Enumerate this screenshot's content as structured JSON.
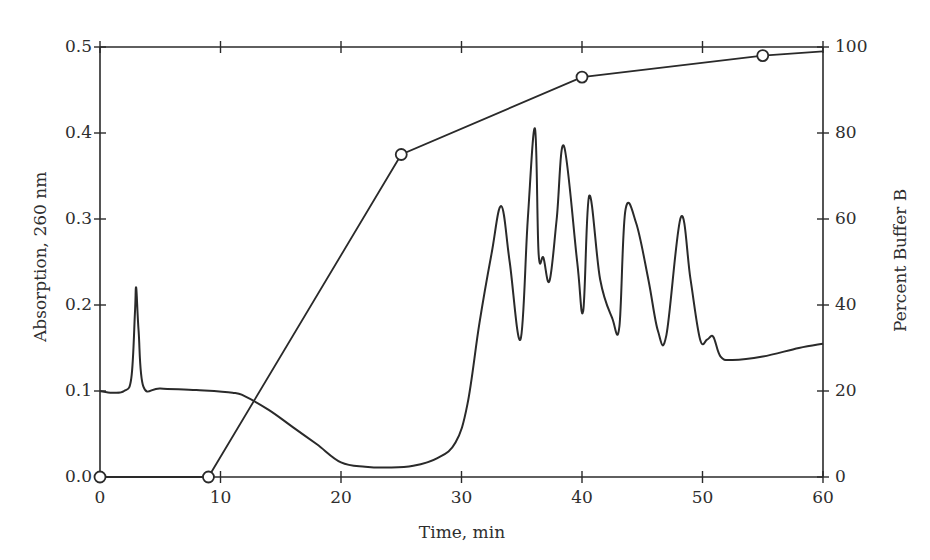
{
  "chart_data": {
    "type": "line",
    "title": "",
    "xlabel": "Time, min",
    "ylabel": "Absorption, 260 nm",
    "y2label": "Percent Buffer B",
    "xlim": [
      0,
      60
    ],
    "ylim": [
      0.0,
      0.5
    ],
    "y2lim": [
      0,
      100
    ],
    "x_ticks": [
      "0",
      "10",
      "20",
      "30",
      "40",
      "50",
      "60"
    ],
    "y_ticks": [
      "0.0",
      "0.1",
      "0.2",
      "0.3",
      "0.4",
      "0.5"
    ],
    "y2_ticks": [
      "0",
      "20",
      "40",
      "60",
      "80",
      "100"
    ],
    "grid": false,
    "legend": null,
    "series": [
      {
        "name": "Absorption, 260 nm",
        "axis": "left",
        "marker": "none",
        "x": [
          0,
          1,
          2,
          2.6,
          2.9,
          3.0,
          3.2,
          3.6,
          5,
          8,
          11,
          12,
          14,
          16,
          18,
          20,
          22,
          24,
          26,
          28,
          29.5,
          30.5,
          31.5,
          32.5,
          33.3,
          34,
          34.9,
          35.5,
          36.1,
          36.4,
          36.8,
          37.3,
          37.9,
          38.5,
          39.6,
          40.1,
          40.6,
          41.5,
          42.5,
          43.1,
          43.6,
          44.5,
          45.5,
          46.3,
          47,
          48.2,
          49,
          49.8,
          50.4,
          50.9,
          51.5,
          52.5,
          55,
          58,
          60
        ],
        "values": [
          0.1,
          0.098,
          0.1,
          0.115,
          0.19,
          0.22,
          0.17,
          0.105,
          0.103,
          0.101,
          0.098,
          0.094,
          0.078,
          0.058,
          0.038,
          0.017,
          0.012,
          0.011,
          0.013,
          0.022,
          0.04,
          0.085,
          0.18,
          0.26,
          0.315,
          0.25,
          0.16,
          0.3,
          0.405,
          0.26,
          0.255,
          0.228,
          0.3,
          0.385,
          0.25,
          0.193,
          0.327,
          0.23,
          0.185,
          0.175,
          0.31,
          0.295,
          0.23,
          0.17,
          0.165,
          0.302,
          0.23,
          0.16,
          0.16,
          0.163,
          0.14,
          0.136,
          0.14,
          0.15,
          0.155
        ]
      },
      {
        "name": "Percent Buffer B",
        "axis": "right",
        "marker": "open-circle",
        "x": [
          0,
          9,
          25,
          40,
          55,
          60
        ],
        "values": [
          0,
          0,
          75,
          93,
          98,
          99
        ]
      }
    ]
  },
  "axes": {
    "xlabel": "Time, min",
    "ylabel": "Absorption, 260 nm",
    "y2label": "Percent Buffer B"
  }
}
